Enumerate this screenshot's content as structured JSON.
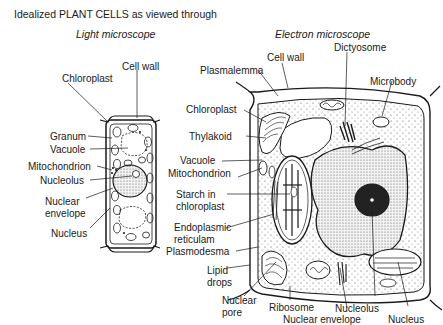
{
  "title": "Idealized PLANT CELLS as viewed through",
  "panels": {
    "light": {
      "heading": "Light microscope",
      "labels": {
        "chloroplast": "Chloroplast",
        "cell_wall": "Cell wall",
        "granum": "Granum",
        "vacuole": "Vacuole",
        "mitochondrion": "Mitochondrion",
        "nucleolus": "Nucleolus",
        "nuclear_envelope_1": "Nuclear",
        "nuclear_envelope_2": "envelope",
        "nucleus": "Nucleus"
      }
    },
    "electron": {
      "heading": "Electron microscope",
      "labels": {
        "cell_wall": "Cell wall",
        "dictyosome": "Dictyosome",
        "plasmalemma": "Plasmalemma",
        "microbody": "Microbody",
        "chloroplast": "Chloroplast",
        "thylakoid": "Thylakoid",
        "vacuole": "Vacuole",
        "mitochondrion": "Mitochondrion",
        "starch_1": "Starch in",
        "starch_2": "chloroplast",
        "er_1": "Endoplasmic",
        "er_2": "reticulam",
        "plasmodesma": "Plasmodesma",
        "lipid_1": "Lipid",
        "lipid_2": "drops",
        "nuclear_pore_1": "Nuclear",
        "nuclear_pore_2": "pore",
        "ribosome": "Ribosome",
        "nucleolus": "Nucleolus",
        "nuclear_envelope": "Nuclear envelope",
        "nucleus": "Nucleus"
      }
    }
  },
  "colors": {
    "ink": "#1a1a1a",
    "stipple": "#d9d9d9",
    "background": "#ffffff"
  }
}
